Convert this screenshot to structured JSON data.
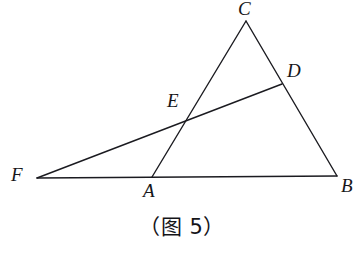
{
  "figure": {
    "caption": "（图 5）",
    "background_color": "#ffffff",
    "stroke_color": "#1b1b20",
    "label_color": "#16161a",
    "width": 364,
    "height": 254
  },
  "labels": {
    "C": "C",
    "D": "D",
    "E": "E",
    "F": "F",
    "A": "A",
    "B": "B"
  },
  "chart_data": {
    "type": "diagram",
    "title": "（图 5）",
    "points": [
      {
        "name": "C",
        "x": 246,
        "y": 21,
        "label_x": 238,
        "label_y": -1
      },
      {
        "name": "D",
        "x": 282,
        "y": 84,
        "label_x": 287,
        "label_y": 61
      },
      {
        "name": "E",
        "x": 186,
        "y": 118,
        "label_x": 167,
        "label_y": 91
      },
      {
        "name": "F",
        "x": 37,
        "y": 178,
        "label_x": 11,
        "label_y": 165
      },
      {
        "name": "A",
        "x": 152,
        "y": 177,
        "label_x": 143,
        "label_y": 181
      },
      {
        "name": "B",
        "x": 337,
        "y": 176,
        "label_x": 341,
        "label_y": 176
      }
    ],
    "segments": [
      {
        "name": "FB",
        "from": "F",
        "to": "B",
        "x1": 37,
        "y1": 178,
        "x2": 337,
        "y2": 176
      },
      {
        "name": "AC",
        "from": "A",
        "to": "C",
        "x1": 152,
        "y1": 177,
        "x2": 246,
        "y2": 21
      },
      {
        "name": "CB",
        "from": "C",
        "to": "B",
        "x1": 246,
        "y1": 21,
        "x2": 337,
        "y2": 176
      },
      {
        "name": "FD",
        "from": "F",
        "to": "D",
        "x1": 37,
        "y1": 178,
        "x2": 282,
        "y2": 84
      }
    ],
    "intersections": [
      {
        "name": "E",
        "of": [
          "AC",
          "FD"
        ],
        "x": 186,
        "y": 118
      },
      {
        "name": "D",
        "of": [
          "CB",
          "FD"
        ],
        "x": 282,
        "y": 84
      }
    ]
  }
}
